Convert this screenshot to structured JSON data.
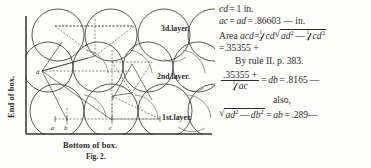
{
  "figure": {
    "caption": "Fig. 2.",
    "y_axis_label": "End of box.",
    "x_axis_label": "Bottom of box.",
    "layer_labels": [
      {
        "id": "layer3",
        "text": "3d.layer."
      },
      {
        "id": "layer2",
        "text": "2nd.layer."
      },
      {
        "id": "layer1",
        "text": "1st.layer."
      }
    ],
    "point_labels": [
      {
        "id": "a",
        "text": "a"
      },
      {
        "id": "b",
        "text": "b"
      },
      {
        "id": "c",
        "text": "c"
      },
      {
        "id": "d",
        "text": "d"
      }
    ]
  },
  "math": {
    "line1": {
      "lhs": "cd",
      "eq": "=",
      "rhs": "1",
      "unit": "in."
    },
    "line2": {
      "lhs": "ac",
      "eq1": "=",
      "mid": "ad",
      "eq2": "=",
      "value": ".86603",
      "approx": "—",
      "unit": "in."
    },
    "line3": {
      "label": "Area",
      "term": "acd",
      "eq": "=",
      "half": {
        "num": "1",
        "den": "2"
      },
      "factor": "cd",
      "radical": {
        "sign": "√",
        "first": "ad",
        "sup1": "2",
        "minus": "—",
        "quarter": {
          "num": "1",
          "den": "4"
        },
        "second": "cd",
        "sup2": "2"
      }
    },
    "line4": {
      "eq": "=",
      "value": ".35355",
      "plus": "+"
    },
    "line5": {
      "text": "By rule II. p. 383."
    },
    "line6": {
      "numerator": ".35355 +",
      "denominator_frac": {
        "num": "1",
        "den": "4"
      },
      "denominator_term": "ac",
      "eq1": "=",
      "result_term": "db",
      "eq2": "=",
      "value": ".8165",
      "approx": "—"
    },
    "line7": {
      "text": "also,"
    },
    "line8": {
      "radical": {
        "sign": "√",
        "first": "ad",
        "sup1": "2",
        "minus": "—",
        "second": "db",
        "sup2": "2"
      },
      "eq1": "=",
      "term": "ab",
      "eq2": "=",
      "value": ".289",
      "approx": "—"
    }
  },
  "colors": {
    "ink": "#2b2b28",
    "paper": "#fdfdfb",
    "line": "#3a3a35"
  }
}
